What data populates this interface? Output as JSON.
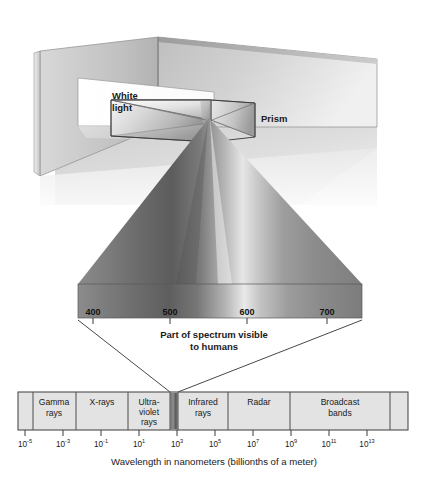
{
  "figure": {
    "title_visible": false,
    "scene": {
      "white_light_label": "White\nlight",
      "white_light_line1": "White",
      "white_light_line2": "light",
      "prism_label": "Prism"
    },
    "visible_spectrum": {
      "caption_line1": "Part of spectrum visible",
      "caption_line2": "to humans",
      "unit": "nm",
      "tick_labels": [
        "400",
        "500",
        "600",
        "700"
      ],
      "tick_values": [
        400,
        500,
        600,
        700
      ],
      "range_nm": [
        380,
        730
      ]
    },
    "em_spectrum": {
      "axis_caption": "Wavelength in nanometers (billionths of a meter)",
      "bands": [
        {
          "name": "gamma-rays",
          "label_line1": "Gamma",
          "label_line2": "rays"
        },
        {
          "name": "x-rays",
          "label_line1": "X-rays",
          "label_line2": ""
        },
        {
          "name": "ultraviolet-rays",
          "label_line1": "Ultra-",
          "label_line2": "violet",
          "label_line3": "rays"
        },
        {
          "name": "visible-light",
          "label_line1": "",
          "label_line2": ""
        },
        {
          "name": "infrared-rays",
          "label_line1": "Infrared",
          "label_line2": "rays"
        },
        {
          "name": "radar",
          "label_line1": "Radar",
          "label_line2": ""
        },
        {
          "name": "broadcast-bands",
          "label_line1": "Broadcast",
          "label_line2": "bands"
        }
      ],
      "axis_ticks": [
        {
          "base": "10",
          "exp": "-5"
        },
        {
          "base": "10",
          "exp": "-3"
        },
        {
          "base": "10",
          "exp": "-1"
        },
        {
          "base": "10",
          "exp": "1"
        },
        {
          "base": "10",
          "exp": "3"
        },
        {
          "base": "10",
          "exp": "5"
        },
        {
          "base": "10",
          "exp": "7"
        },
        {
          "base": "10",
          "exp": "9"
        },
        {
          "base": "10",
          "exp": "11"
        },
        {
          "base": "10",
          "exp": "13"
        }
      ]
    },
    "colors": {
      "background": "#ffffff",
      "band_fill": "#e3e3e3",
      "band_stroke": "#4d4d4d",
      "text": "#1a1a1a",
      "wall_light": "#f2f2f2",
      "wall_mid": "#c9c9c9",
      "wall_dark": "#a8a8a8",
      "beam_dark": "#6e6e6e",
      "beam_light": "#d9d9d9"
    }
  }
}
